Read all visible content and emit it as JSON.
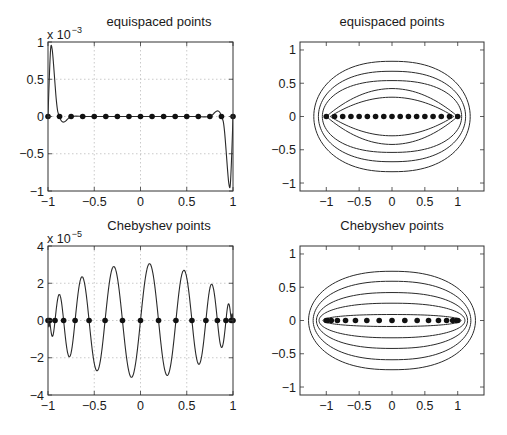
{
  "figure": {
    "width": 507,
    "height": 435,
    "background": "#ffffff",
    "line_color": "#2a2a2a",
    "grid_color": "#bdbdbd"
  },
  "chart_data": [
    {
      "id": "top-left",
      "type": "line",
      "title": "equispaced points",
      "exponent_label": "x 10",
      "exponent_power": "−3",
      "box": {
        "left": 48,
        "top": 42,
        "right": 233,
        "bottom": 191
      },
      "xlim": [
        -1,
        1
      ],
      "ylim": [
        -1,
        1
      ],
      "grid": true,
      "xticks": [
        -1,
        -0.5,
        0,
        0.5,
        1
      ],
      "xtick_labels": [
        "−1",
        "−0.5",
        "0",
        "0.5",
        "1"
      ],
      "yticks": [
        -1,
        -0.5,
        0,
        0.5,
        1
      ],
      "ytick_labels": [
        "−1",
        "−0.5",
        "0",
        "0.5",
        "1"
      ],
      "series": [
        {
          "name": "error curve (scaled 1e-3)",
          "style": "line",
          "x": [
            -1,
            -0.985,
            -0.97,
            -0.955,
            -0.94,
            -0.925,
            -0.91,
            -0.895,
            -0.875,
            -0.86,
            -0.84,
            -0.82,
            -0.8,
            -0.78,
            -0.75,
            -0.7,
            -0.6,
            -0.5,
            -0.3,
            0,
            0.3,
            0.5,
            0.6,
            0.7,
            0.75,
            0.78,
            0.8,
            0.82,
            0.84,
            0.86,
            0.875,
            0.895,
            0.91,
            0.925,
            0.94,
            0.955,
            0.97,
            0.985,
            1
          ],
          "y": [
            0,
            0.55,
            0.93,
            0.9,
            0.7,
            0.45,
            0.22,
            0.07,
            0,
            -0.05,
            -0.075,
            -0.07,
            -0.05,
            -0.025,
            0,
            0.005,
            0,
            0,
            0,
            0,
            0,
            0,
            0,
            -0.005,
            0,
            0.025,
            0.05,
            0.07,
            0.075,
            0.05,
            0,
            -0.07,
            -0.22,
            -0.45,
            -0.7,
            -0.9,
            -0.93,
            -0.55,
            0
          ]
        },
        {
          "name": "equispaced nodes",
          "style": "markers",
          "x": [
            -1,
            -0.875,
            -0.75,
            -0.625,
            -0.5,
            -0.375,
            -0.25,
            -0.125,
            0,
            0.125,
            0.25,
            0.375,
            0.5,
            0.625,
            0.75,
            0.875,
            1
          ],
          "y": [
            0,
            0,
            0,
            0,
            0,
            0,
            0,
            0,
            0,
            0,
            0,
            0,
            0,
            0,
            0,
            0,
            0
          ]
        }
      ]
    },
    {
      "id": "top-right",
      "type": "line",
      "title": "equispaced points",
      "box": {
        "left": 300,
        "top": 42,
        "right": 484,
        "bottom": 191
      },
      "xlim": [
        -1.4,
        1.4
      ],
      "ylim": [
        -1.12,
        1.12
      ],
      "grid": false,
      "xticks": [
        -1,
        -0.5,
        0,
        0.5,
        1
      ],
      "xtick_labels": [
        "−1",
        "−0.5",
        "0",
        "0.5",
        "1"
      ],
      "yticks": [
        -1,
        -0.5,
        0,
        0.5,
        1
      ],
      "ytick_labels": [
        "−1",
        "−0.5",
        "0",
        "0.5",
        "1"
      ],
      "level_curves": [
        {
          "shape": "oval",
          "half_width": 1.19,
          "half_height": 0.83
        },
        {
          "shape": "oval",
          "half_width": 1.12,
          "half_height": 0.68
        },
        {
          "shape": "oval",
          "half_width": 1.06,
          "half_height": 0.54
        },
        {
          "shape": "lens",
          "half_width": 1.0,
          "half_height": 0.42
        },
        {
          "shape": "lens",
          "half_width": 0.94,
          "half_height": 0.29
        }
      ],
      "series": [
        {
          "name": "equispaced nodes",
          "style": "markers",
          "x": [
            -1,
            -0.875,
            -0.75,
            -0.625,
            -0.5,
            -0.375,
            -0.25,
            -0.125,
            0,
            0.125,
            0.25,
            0.375,
            0.5,
            0.625,
            0.75,
            0.875,
            1
          ],
          "y": [
            0,
            0,
            0,
            0,
            0,
            0,
            0,
            0,
            0,
            0,
            0,
            0,
            0,
            0,
            0,
            0,
            0
          ]
        }
      ]
    },
    {
      "id": "bottom-left",
      "type": "line",
      "title": "Chebyshev points",
      "exponent_label": "x 10",
      "exponent_power": "−5",
      "box": {
        "left": 48,
        "top": 246,
        "right": 233,
        "bottom": 395
      },
      "xlim": [
        -1,
        1
      ],
      "ylim": [
        -4,
        4
      ],
      "grid": true,
      "xticks": [
        -1,
        -0.5,
        0,
        0.5,
        1
      ],
      "xtick_labels": [
        "−1",
        "−0.5",
        "0",
        "0.5",
        "1"
      ],
      "yticks": [
        -4,
        -2,
        0,
        2,
        4
      ],
      "ytick_labels": [
        "−4",
        "−2",
        "0",
        "2",
        "4"
      ],
      "series": [
        {
          "name": "error curve (scaled 1e-5)",
          "style": "line",
          "extrema_x": [
            -0.985,
            -0.87,
            -0.765,
            -0.625,
            -0.46,
            -0.28,
            -0.095,
            0.095,
            0.28,
            0.46,
            0.625,
            0.765,
            0.87,
            0.955
          ],
          "extrema_y": [
            -0.85,
            1.4,
            -1.95,
            2.35,
            -2.7,
            2.9,
            -3.05,
            3.05,
            -2.95,
            2.7,
            -2.35,
            1.95,
            -1.45,
            0.9
          ]
        },
        {
          "name": "Chebyshev nodes",
          "style": "markers",
          "x": [
            -1,
            -0.981,
            -0.924,
            -0.831,
            -0.707,
            -0.556,
            -0.383,
            -0.195,
            0,
            0.195,
            0.383,
            0.556,
            0.707,
            0.831,
            0.924,
            0.981,
            1
          ],
          "y": [
            0,
            0,
            0,
            0,
            0,
            0,
            0,
            0,
            0,
            0,
            0,
            0,
            0,
            0,
            0,
            0,
            0
          ]
        }
      ]
    },
    {
      "id": "bottom-right",
      "type": "line",
      "title": "Chebyshev points",
      "box": {
        "left": 300,
        "top": 246,
        "right": 484,
        "bottom": 395
      },
      "xlim": [
        -1.4,
        1.4
      ],
      "ylim": [
        -1.12,
        1.12
      ],
      "grid": false,
      "xticks": [
        -1,
        -0.5,
        0,
        0.5,
        1
      ],
      "xtick_labels": [
        "−1",
        "−0.5",
        "0",
        "0.5",
        "1"
      ],
      "yticks": [
        -1,
        -0.5,
        0,
        0.5,
        1
      ],
      "ytick_labels": [
        "−1",
        "−0.5",
        "0",
        "0.5",
        "1"
      ],
      "level_curves": [
        {
          "shape": "oval",
          "half_width": 1.27,
          "half_height": 0.74
        },
        {
          "shape": "oval",
          "half_width": 1.2,
          "half_height": 0.59
        },
        {
          "shape": "oval",
          "half_width": 1.15,
          "half_height": 0.42
        },
        {
          "shape": "oval",
          "half_width": 1.11,
          "half_height": 0.26
        },
        {
          "shape": "oval",
          "half_width": 1.05,
          "half_height": 0.09
        }
      ],
      "series": [
        {
          "name": "Chebyshev nodes",
          "style": "markers",
          "x": [
            -1,
            -0.981,
            -0.924,
            -0.831,
            -0.707,
            -0.556,
            -0.383,
            -0.195,
            0,
            0.195,
            0.383,
            0.556,
            0.707,
            0.831,
            0.924,
            0.981,
            1
          ],
          "y": [
            0,
            0,
            0,
            0,
            0,
            0,
            0,
            0,
            0,
            0,
            0,
            0,
            0,
            0,
            0,
            0,
            0
          ]
        }
      ]
    }
  ]
}
